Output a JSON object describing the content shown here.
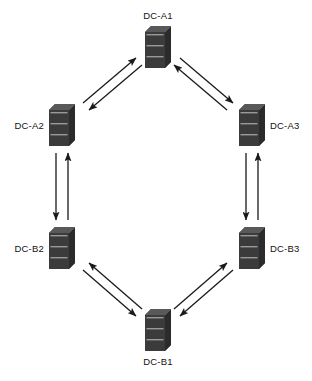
{
  "diagram": {
    "type": "network-topology",
    "width": 312,
    "height": 381,
    "background_color": "#ffffff",
    "node_icon": "server-icon",
    "node_color": "#3b3b3b",
    "node_top_color": "#595959",
    "edge_color": "#1a1a1a",
    "label_color": "#121212",
    "nodes": [
      {
        "id": "dc-a1",
        "label": "DC-A1",
        "x": 158,
        "y": 47,
        "label_position": "top"
      },
      {
        "id": "dc-a2",
        "label": "DC-A2",
        "x": 62,
        "y": 125,
        "label_position": "left"
      },
      {
        "id": "dc-a3",
        "label": "DC-A3",
        "x": 252,
        "y": 125,
        "label_position": "right"
      },
      {
        "id": "dc-b2",
        "label": "DC-B2",
        "x": 62,
        "y": 248,
        "label_position": "left"
      },
      {
        "id": "dc-b3",
        "label": "DC-B3",
        "x": 252,
        "y": 248,
        "label_position": "right"
      },
      {
        "id": "dc-b1",
        "label": "DC-B1",
        "x": 158,
        "y": 330,
        "label_position": "bottom"
      }
    ],
    "edges": [
      {
        "id": "edge-a2-a1",
        "from": "dc-a2",
        "to": "dc-a1",
        "bidirectional": true
      },
      {
        "id": "edge-a1-a3",
        "from": "dc-a1",
        "to": "dc-a3",
        "bidirectional": true
      },
      {
        "id": "edge-a3-b3",
        "from": "dc-a3",
        "to": "dc-b3",
        "bidirectional": true
      },
      {
        "id": "edge-b3-b1",
        "from": "dc-b3",
        "to": "dc-b1",
        "bidirectional": true
      },
      {
        "id": "edge-b1-b2",
        "from": "dc-b1",
        "to": "dc-b2",
        "bidirectional": true
      },
      {
        "id": "edge-b2-a2",
        "from": "dc-b2",
        "to": "dc-a2",
        "bidirectional": true
      }
    ]
  }
}
